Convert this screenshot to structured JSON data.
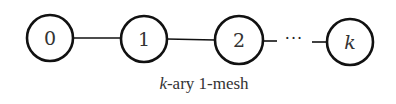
{
  "diagram": {
    "nodes": [
      {
        "label": "0",
        "italic": false
      },
      {
        "label": "1",
        "italic": false
      },
      {
        "label": "2",
        "italic": false
      },
      {
        "label": "k",
        "italic": true
      }
    ],
    "ellipsis": "···",
    "caption_var": "k",
    "caption_rest": "-ary 1-mesh"
  }
}
